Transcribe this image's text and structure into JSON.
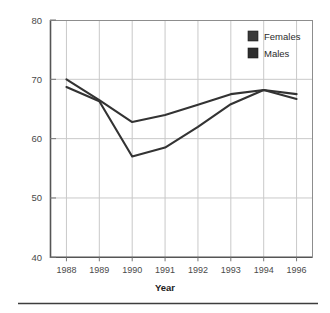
{
  "chart_data": {
    "type": "line",
    "title": "",
    "subtitle": "",
    "xlabel": "Year",
    "ylabel": "",
    "categories": [
      "1988",
      "1989",
      "1990",
      "1991",
      "1992",
      "1993",
      "1994",
      "1996"
    ],
    "series": [
      {
        "name": "Females",
        "color": "#333333",
        "values": [
          70.0,
          66.5,
          62.8,
          64.0,
          65.7,
          67.5,
          68.2,
          67.5
        ]
      },
      {
        "name": "Males",
        "color": "#333333",
        "values": [
          68.7,
          66.3,
          57.0,
          58.5,
          62.0,
          65.8,
          68.2,
          66.7
        ]
      }
    ],
    "ylim": [
      40,
      80
    ],
    "yticks": [
      40,
      50,
      60,
      70,
      80
    ],
    "ytick_labels": [
      "40",
      "50",
      "60",
      "70",
      "80"
    ],
    "grid": {
      "horizontal": true,
      "vertical": true,
      "color": "#c9c9c9"
    },
    "legend": {
      "position": "top-right-inside",
      "entries": [
        {
          "label": "Females",
          "swatch_color": "#3a3a3a"
        },
        {
          "label": "Males",
          "swatch_color": "#2e2e2e"
        }
      ]
    },
    "axis_color": "#555555",
    "line_color": "#2b2b2b"
  },
  "figure": {
    "footer_rule": true
  }
}
